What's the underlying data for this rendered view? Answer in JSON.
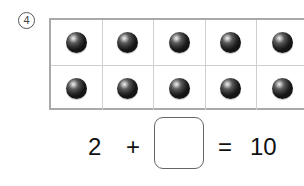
{
  "problem": {
    "number_label": "4",
    "grid": {
      "rows": 2,
      "columns_visible": 5,
      "cells": [
        [
          "ball",
          "ball",
          "ball",
          "ball",
          "ball"
        ],
        [
          "ball",
          "ball",
          "ball",
          "ball",
          "ball"
        ]
      ]
    },
    "equation": {
      "left_operand": "2",
      "operator": "+",
      "blank_value": "",
      "equals": "=",
      "result": "10"
    }
  }
}
